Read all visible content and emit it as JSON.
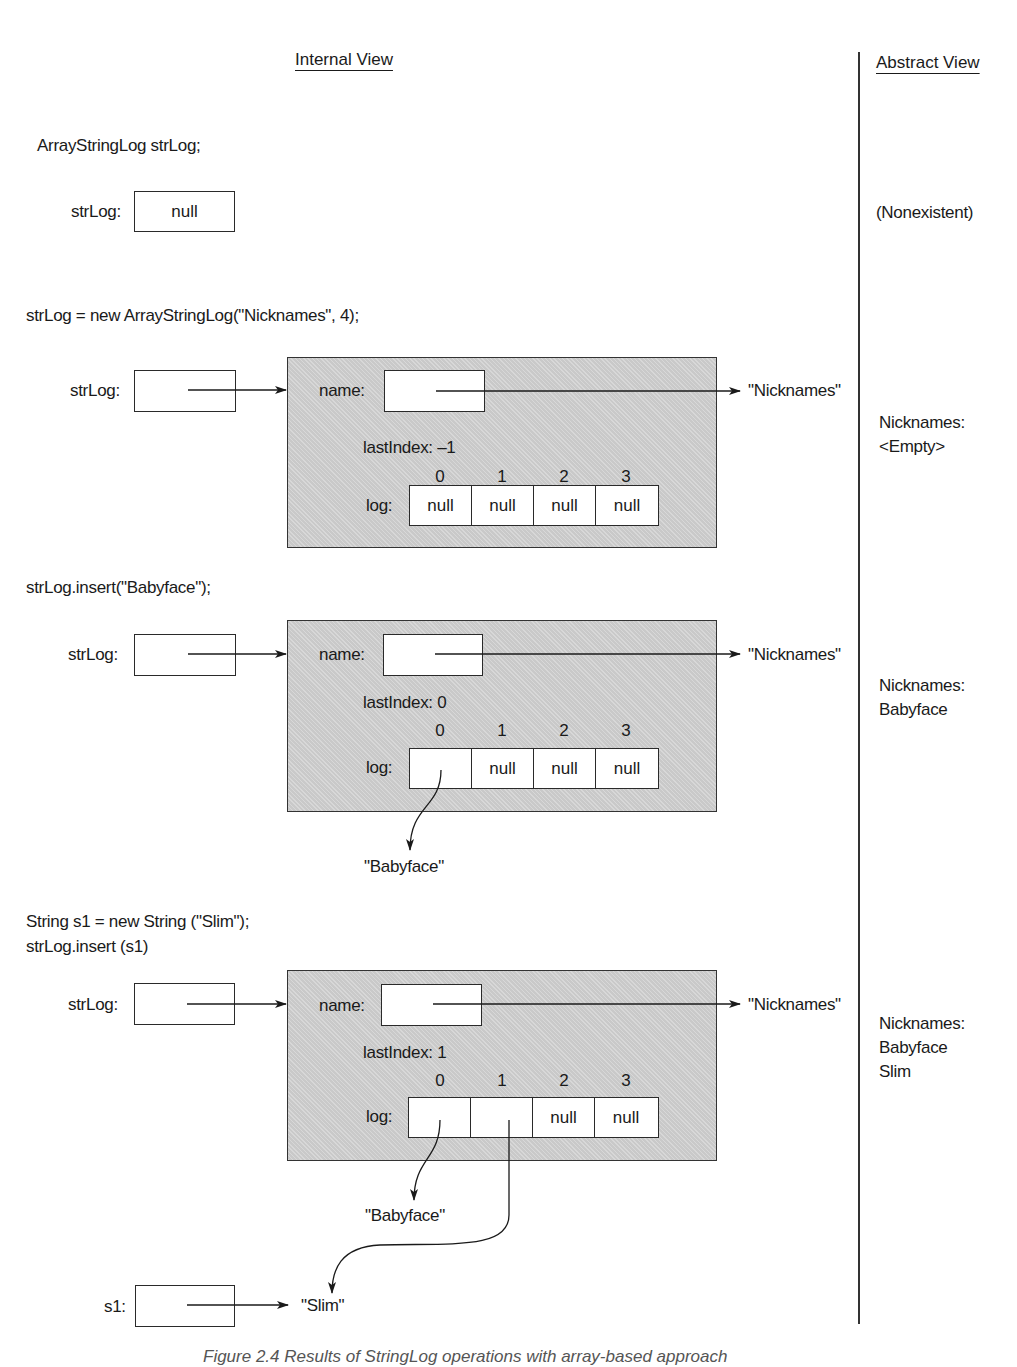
{
  "headers": {
    "internal": "Internal View",
    "abstract": "Abstract View"
  },
  "steps": [
    {
      "code": [
        "ArrayStringLog strLog;"
      ],
      "ref_label": "strLog:",
      "ref_value": "null",
      "abstract": [
        "(Nonexistent)"
      ]
    },
    {
      "code": [
        "strLog = new ArrayStringLog(\"Nicknames\", 4);"
      ],
      "ref_label": "strLog:",
      "name_label": "name:",
      "name_target": "\"Nicknames\"",
      "last_index_label": "lastIndex: –1",
      "log_label": "log:",
      "indices": [
        "0",
        "1",
        "2",
        "3"
      ],
      "cells": [
        "null",
        "null",
        "null",
        "null"
      ],
      "abstract": [
        "Nicknames:",
        "<Empty>"
      ]
    },
    {
      "code": [
        "strLog.insert(\"Babyface\");"
      ],
      "ref_label": "strLog:",
      "name_label": "name:",
      "name_target": "\"Nicknames\"",
      "last_index_label": "lastIndex: 0",
      "log_label": "log:",
      "indices": [
        "0",
        "1",
        "2",
        "3"
      ],
      "cells": [
        "",
        "null",
        "null",
        "null"
      ],
      "targets": [
        "\"Babyface\""
      ],
      "abstract": [
        "Nicknames:",
        "Babyface"
      ]
    },
    {
      "code": [
        "String s1 = new String (\"Slim\");",
        "strLog.insert (s1)"
      ],
      "ref_label": "strLog:",
      "name_label": "name:",
      "name_target": "\"Nicknames\"",
      "last_index_label": "lastIndex: 1",
      "log_label": "log:",
      "indices": [
        "0",
        "1",
        "2",
        "3"
      ],
      "cells": [
        "",
        "",
        "null",
        "null"
      ],
      "targets": [
        "\"Babyface\"",
        "\"Slim\""
      ],
      "s1_label": "s1:",
      "abstract": [
        "Nicknames:",
        "Babyface",
        "Slim"
      ]
    }
  ],
  "caption": "Figure 2.4 Results of StringLog operations with array-based approach"
}
